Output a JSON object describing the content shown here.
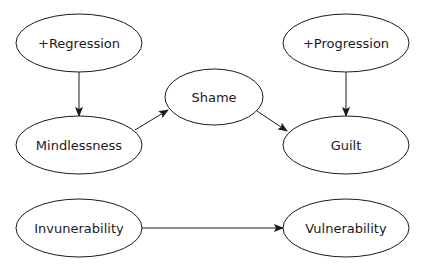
{
  "diagram": {
    "type": "flow",
    "nodes": [
      {
        "id": "regression",
        "label": "+Regression",
        "cx": 79,
        "cy": 43,
        "rx": 63,
        "ry": 29
      },
      {
        "id": "mindlessness",
        "label": "Mindlessness",
        "cx": 79,
        "cy": 145,
        "rx": 63,
        "ry": 29
      },
      {
        "id": "shame",
        "label": "Shame",
        "cx": 214,
        "cy": 97,
        "rx": 49,
        "ry": 28
      },
      {
        "id": "progression",
        "label": "+Progression",
        "cx": 346,
        "cy": 43,
        "rx": 63,
        "ry": 29
      },
      {
        "id": "guilt",
        "label": "Guilt",
        "cx": 346,
        "cy": 145,
        "rx": 63,
        "ry": 29
      },
      {
        "id": "invunerability",
        "label": "Invunerability",
        "cx": 79,
        "cy": 228,
        "rx": 63,
        "ry": 29
      },
      {
        "id": "vulnerability",
        "label": "Vulnerability",
        "cx": 346,
        "cy": 228,
        "rx": 63,
        "ry": 29
      }
    ],
    "edges": [
      {
        "from": "regression",
        "to": "mindlessness",
        "x1": 79,
        "y1": 72,
        "x2": 79,
        "y2": 116
      },
      {
        "from": "mindlessness",
        "to": "shame",
        "x1": 135,
        "y1": 130,
        "x2": 168,
        "y2": 110
      },
      {
        "from": "shame",
        "to": "guilt",
        "x1": 257,
        "y1": 111,
        "x2": 287,
        "y2": 131
      },
      {
        "from": "progression",
        "to": "guilt",
        "x1": 346,
        "y1": 72,
        "x2": 346,
        "y2": 116
      },
      {
        "from": "invunerability",
        "to": "vulnerability",
        "x1": 142,
        "y1": 228,
        "x2": 283,
        "y2": 228
      }
    ]
  }
}
